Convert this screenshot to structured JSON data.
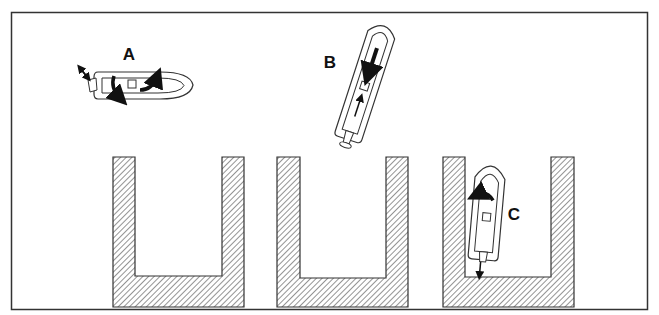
{
  "diagram": {
    "type": "boat-docking-maneuver-illustration",
    "frame": {
      "stroke": "#333333"
    },
    "colors": {
      "line": "#222222",
      "hatch": "#555555",
      "background": "#ffffff"
    },
    "labels": {
      "a": "A",
      "b": "B",
      "c": "C"
    },
    "boats": [
      {
        "id": "A",
        "orientation": "horizontal, bow right",
        "arrows": [
          "curved-down (port side)",
          "curved-up (starboard side)",
          "outboard thrust diagonal"
        ]
      },
      {
        "id": "B",
        "orientation": "tilted, bow up-left",
        "arrows": [
          "straight down (reverse)",
          "small up arrow at stern"
        ]
      },
      {
        "id": "C",
        "orientation": "near-vertical, bow up, inside dock 3",
        "arrows": [
          "curved left",
          "small down arrow at stern"
        ]
      }
    ],
    "docks": [
      {
        "id": "dock-1",
        "shape": "U-shaped slip, hatched"
      },
      {
        "id": "dock-2",
        "shape": "U-shaped slip, hatched"
      },
      {
        "id": "dock-3",
        "shape": "U-shaped slip, hatched, boat C inside"
      }
    ]
  }
}
